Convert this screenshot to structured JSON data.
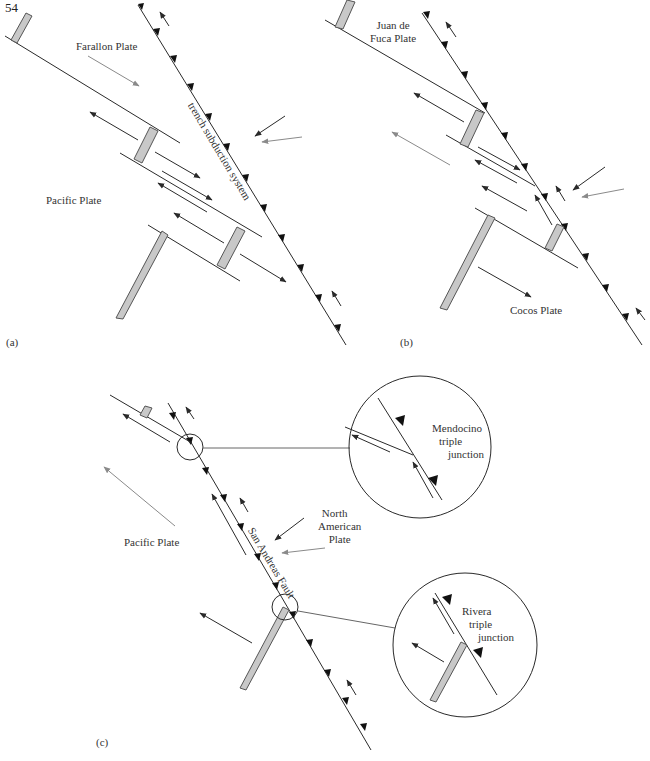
{
  "page_number": "54",
  "panels": {
    "a": {
      "label": "(a)",
      "plates": [
        "Farallon Plate",
        "Pacific Plate"
      ],
      "fault_label": "trench subduction system"
    },
    "b": {
      "label": "(b)",
      "plates": [
        "Juan de Fuca Plate",
        "Cocos Plate"
      ],
      "juan_de_fuca_line1": "Juan de",
      "juan_de_fuca_line2": "Fuca Plate"
    },
    "c": {
      "label": "(c)",
      "plates": [
        "Pacific Plate",
        "North American Plate"
      ],
      "north_american_line1": "North",
      "north_american_line2": "American",
      "north_american_line3": "Plate",
      "fault_label": "San Andreas Fault",
      "insets": [
        {
          "name": "Mendocino triple junction",
          "line1": "Mendocino",
          "line2": "triple",
          "line3": "junction"
        },
        {
          "name": "Rivera triple junction",
          "line1": "Rivera",
          "line2": "triple",
          "line3": "junction"
        }
      ]
    }
  },
  "colors": {
    "line": "#2a2a2a",
    "ridge_fill": "#c8c8c8",
    "gray_arrow": "#8a8a8a"
  }
}
